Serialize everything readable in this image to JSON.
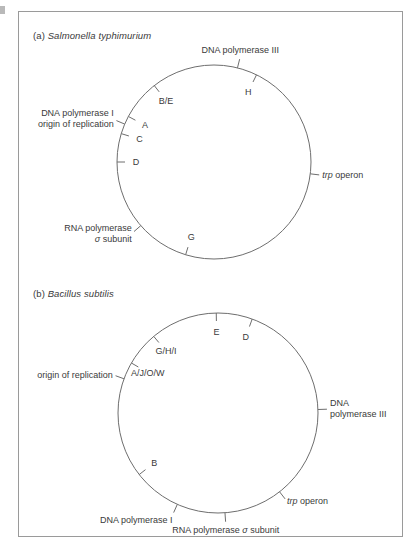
{
  "figure": {
    "background_color": "#ffffff",
    "frame_color": "#9a9a9a",
    "line_color": "#6e6e6e",
    "text_color": "#3a3a3a"
  },
  "panels": [
    {
      "id": "a",
      "tag": "(a)",
      "species": "Salmonella typhimurium",
      "circle": {
        "cx": 214,
        "cy": 162,
        "r": 97
      },
      "annotations": [
        {
          "name": "dna-polymerase-iii",
          "text": "DNA polymerase III",
          "angle_deg": -76,
          "align": "center"
        },
        {
          "name": "dna-polymerase-i-origin-of-replication",
          "line1": "DNA polymerase I",
          "line2": "origin of replication",
          "angle_deg": -157,
          "align": "right"
        },
        {
          "name": "rna-polymerase-sigma-subunit",
          "line1": "RNA polymerase",
          "line2_pre": "",
          "sigma": "σ",
          "line2_post": " subunit",
          "angle_deg": 139,
          "align": "right"
        },
        {
          "name": "trp-operon",
          "italic": "trp",
          "rest": " operon",
          "angle_deg": 7,
          "align": "left"
        }
      ],
      "gene_markers": [
        {
          "name": "gene-marker-h",
          "label": "H",
          "angle_deg": -64
        },
        {
          "name": "gene-marker-be",
          "label": "B/E",
          "angle_deg": -128
        },
        {
          "name": "gene-marker-a",
          "label": "A",
          "angle_deg": -152
        },
        {
          "name": "gene-marker-c",
          "label": "C",
          "angle_deg": -163
        },
        {
          "name": "gene-marker-d",
          "label": "D",
          "angle_deg": 180
        },
        {
          "name": "gene-marker-g",
          "label": "G",
          "angle_deg": 107
        }
      ]
    },
    {
      "id": "b",
      "tag": "(b)",
      "species": "Bacillus subtilis",
      "circle": {
        "cx": 218,
        "cy": 413,
        "r": 100
      },
      "annotations": [
        {
          "name": "origin-of-replication",
          "text": "origin of replication",
          "angle_deg": -160,
          "align": "right"
        },
        {
          "name": "dna-polymerase-iii",
          "line1": "DNA",
          "line2": "polymerase III",
          "angle_deg": -2,
          "align": "left"
        },
        {
          "name": "trp-operon",
          "italic": "trp",
          "rest": " operon",
          "angle_deg": 52,
          "align": "left"
        },
        {
          "name": "rna-polymerase-sigma-subunit",
          "pre": "RNA polymerase ",
          "sigma": "σ",
          "post": " subunit",
          "angle_deg": 86,
          "align": "center"
        },
        {
          "name": "dna-polymerase-i",
          "text": "DNA polymerase I",
          "angle_deg": 114,
          "align": "right"
        }
      ],
      "gene_markers": [
        {
          "name": "gene-marker-e",
          "label": "E",
          "angle_deg": -91
        },
        {
          "name": "gene-marker-d",
          "label": "D",
          "angle_deg": -70
        },
        {
          "name": "gene-marker-ghi",
          "label": "G/H/I",
          "angle_deg": -130
        },
        {
          "name": "gene-marker-ajow",
          "label": "A/J/O/W",
          "angle_deg": -150
        },
        {
          "name": "gene-marker-b",
          "label": "B",
          "angle_deg": 142
        }
      ]
    }
  ]
}
